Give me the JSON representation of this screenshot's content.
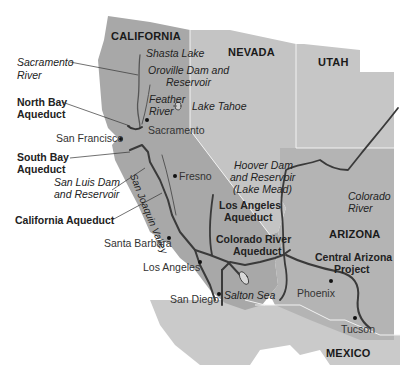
{
  "map": {
    "title": "Western US Water Projects",
    "colors": {
      "background": "#ffffff",
      "california": "#a8a8a8",
      "nevada": "#c4c4c4",
      "utah": "#c6c6c6",
      "arizona": "#b4b4b4",
      "mexico": "#cacaca",
      "border": "#f2f2f2",
      "aqueduct": "#3a3a3a",
      "river": "#555555",
      "text": "#222222"
    },
    "states": [
      {
        "name": "CALIFORNIA"
      },
      {
        "name": "NEVADA"
      },
      {
        "name": "UTAH"
      },
      {
        "name": "ARIZONA"
      },
      {
        "name": "MEXICO"
      }
    ],
    "cities": [
      {
        "name": "Sacramento"
      },
      {
        "name": "San Francisco"
      },
      {
        "name": "Fresno"
      },
      {
        "name": "Santa Barbara"
      },
      {
        "name": "Los Angeles"
      },
      {
        "name": "San Diego"
      },
      {
        "name": "Phoenix"
      },
      {
        "name": "Tucson"
      }
    ],
    "water_features": [
      {
        "name": "Shasta Lake"
      },
      {
        "name": "Oroville Dam and Reservoir",
        "line1": "Oroville Dam and",
        "line2": "Reservoir"
      },
      {
        "name": "Feather River",
        "line1": "Feather",
        "line2": "River"
      },
      {
        "name": "Lake Tahoe"
      },
      {
        "name": "Sacramento River",
        "line1": "Sacramento",
        "line2": "River"
      },
      {
        "name": "San Luis Dam and Reservoir",
        "line1": "San Luis Dam",
        "line2": "and Reservoir"
      },
      {
        "name": "San Joaquin Valley"
      },
      {
        "name": "Hoover Dam and Reservoir (Lake Mead)",
        "line1": "Hoover Dam",
        "line2": "and Reservoir",
        "line3": "(Lake Mead)"
      },
      {
        "name": "Colorado River",
        "line1": "Colorado",
        "line2": "River"
      },
      {
        "name": "Salton Sea"
      }
    ],
    "aqueducts": [
      {
        "name": "North Bay Aqueduct",
        "line1": "North Bay",
        "line2": "Aqueduct"
      },
      {
        "name": "South Bay Aqueduct",
        "line1": "South Bay",
        "line2": "Aqueduct"
      },
      {
        "name": "California Aqueduct"
      },
      {
        "name": "Los Angeles Aqueduct",
        "line1": "Los Angeles",
        "line2": "Aqueduct"
      },
      {
        "name": "Colorado River Aqueduct",
        "line1": "Colorado River",
        "line2": "Aqueduct"
      },
      {
        "name": "Central Arizona Project",
        "line1": "Central Arizona",
        "line2": "Project"
      }
    ]
  }
}
